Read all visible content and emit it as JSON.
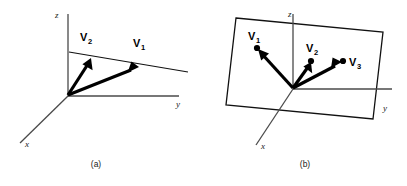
{
  "figure": {
    "background_color": "#ffffff",
    "ink_color": "#000000",
    "axis_color": "#4a4a4a",
    "width": 407,
    "height": 186
  },
  "panels": [
    {
      "id": "panel-a",
      "caption": "(a)",
      "description": "Two vectors lying in a plane seen edge-on",
      "axes": [
        {
          "name": "z",
          "label": "z",
          "label_x": 55,
          "label_y": 17
        },
        {
          "name": "y",
          "label": "y",
          "label_x": 177,
          "label_y": 106
        },
        {
          "name": "x",
          "label": "x",
          "label_x": 26,
          "label_y": 146
        }
      ],
      "vectors": [
        {
          "name": "V1",
          "label": "V",
          "subscript": "1",
          "label_x": 136,
          "label_y": 44
        },
        {
          "name": "V2",
          "label": "V",
          "subscript": "2",
          "label_x": 83,
          "label_y": 38
        }
      ]
    },
    {
      "id": "panel-b",
      "caption": "(b)",
      "description": "Three vectors lying in a tilted plane shown as a parallelogram",
      "axes": [
        {
          "name": "z",
          "label": "z",
          "label_x": 288,
          "label_y": 15
        },
        {
          "name": "y",
          "label": "y",
          "label_x": 384,
          "label_y": 110
        },
        {
          "name": "x",
          "label": "x",
          "label_x": 262,
          "label_y": 148
        }
      ],
      "vectors": [
        {
          "name": "V1",
          "label": "V",
          "subscript": "1",
          "label_x": 251,
          "label_y": 38
        },
        {
          "name": "V2",
          "label": "V",
          "subscript": "2",
          "label_x": 309,
          "label_y": 50
        },
        {
          "name": "V3",
          "label": "V",
          "subscript": "3",
          "label_x": 350,
          "label_y": 63
        }
      ]
    }
  ],
  "captions": {
    "panel_a": "(a)",
    "panel_b": "(b)"
  }
}
